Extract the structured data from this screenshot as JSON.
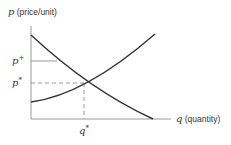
{
  "y_axis": {
    "var": "p",
    "unit": "(price/unit)"
  },
  "x_axis": {
    "var": "q",
    "unit": "(quantity)"
  },
  "labels": {
    "p_plus_base": "p",
    "p_plus_sup": "+",
    "p_star_base": "p",
    "p_star_sup": "*",
    "q_star_base": "q",
    "q_star_sup": "*"
  },
  "curves": [
    {
      "name": "demand",
      "shape": "decreasing convex"
    },
    {
      "name": "supply",
      "shape": "increasing convex"
    }
  ],
  "colors": {
    "curve": "#333333",
    "axis": "#888888",
    "guide": "#999999"
  }
}
